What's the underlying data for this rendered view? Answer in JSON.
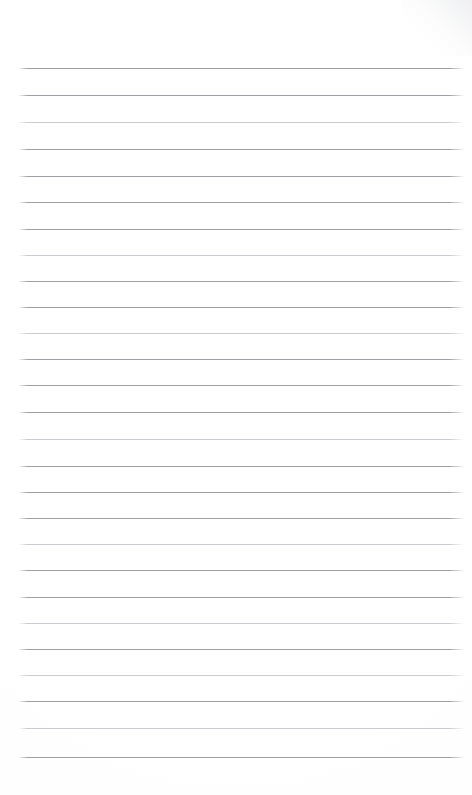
{
  "document": {
    "kind": "lined-paper-sheet",
    "title": "",
    "body_text": "",
    "is_blank": true,
    "page_width_px": 472,
    "page_height_px": 795,
    "background_color": "#fefefe",
    "corner_shading": "top-right",
    "writing_content": []
  },
  "ruling": {
    "line_count": 27,
    "first_line_y_px": 68,
    "last_line_y_px": 757,
    "line_spacing_px": 26.5,
    "line_left_x_px": 18,
    "line_right_x_px": 465,
    "line_thickness_px": 1,
    "line_color": "#9ea0a6",
    "line_color_light": "#c9cbd0",
    "top_margin_px": 68,
    "bottom_margin_px": 38,
    "left_margin_px": 18,
    "right_margin_px": 7,
    "has_vertical_margin_rule": false,
    "lines": [
      {
        "index": 1,
        "y": 68,
        "tone": "dark"
      },
      {
        "index": 2,
        "y": 95,
        "tone": "dark"
      },
      {
        "index": 3,
        "y": 122,
        "tone": "light"
      },
      {
        "index": 4,
        "y": 149,
        "tone": "dark"
      },
      {
        "index": 5,
        "y": 176,
        "tone": "dark"
      },
      {
        "index": 6,
        "y": 202,
        "tone": "dark"
      },
      {
        "index": 7,
        "y": 229,
        "tone": "dark"
      },
      {
        "index": 8,
        "y": 255,
        "tone": "light"
      },
      {
        "index": 9,
        "y": 281,
        "tone": "dark"
      },
      {
        "index": 10,
        "y": 307,
        "tone": "dark"
      },
      {
        "index": 11,
        "y": 333,
        "tone": "light"
      },
      {
        "index": 12,
        "y": 359,
        "tone": "dark"
      },
      {
        "index": 13,
        "y": 385,
        "tone": "dark"
      },
      {
        "index": 14,
        "y": 412,
        "tone": "dark"
      },
      {
        "index": 15,
        "y": 439,
        "tone": "light"
      },
      {
        "index": 16,
        "y": 466,
        "tone": "dark"
      },
      {
        "index": 17,
        "y": 492,
        "tone": "dark"
      },
      {
        "index": 18,
        "y": 518,
        "tone": "dark"
      },
      {
        "index": 19,
        "y": 544,
        "tone": "light"
      },
      {
        "index": 20,
        "y": 570,
        "tone": "dark"
      },
      {
        "index": 21,
        "y": 597,
        "tone": "dark"
      },
      {
        "index": 22,
        "y": 623,
        "tone": "light"
      },
      {
        "index": 23,
        "y": 649,
        "tone": "dark"
      },
      {
        "index": 24,
        "y": 675,
        "tone": "light"
      },
      {
        "index": 25,
        "y": 701,
        "tone": "dark"
      },
      {
        "index": 26,
        "y": 728,
        "tone": "light"
      },
      {
        "index": 27,
        "y": 757,
        "tone": "dark"
      }
    ]
  }
}
